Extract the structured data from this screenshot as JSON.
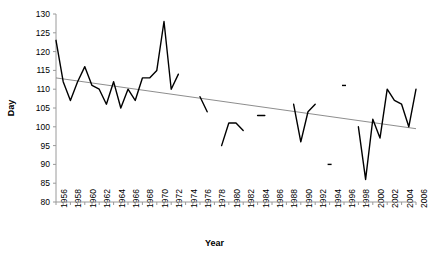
{
  "chart_data": {
    "type": "line",
    "title": "",
    "xlabel": "Year",
    "ylabel": "Day",
    "xlim": [
      1956,
      2006
    ],
    "ylim": [
      80,
      130
    ],
    "yticks": [
      80,
      85,
      90,
      95,
      100,
      105,
      110,
      115,
      120,
      125,
      130
    ],
    "xticks": [
      1956,
      1958,
      1960,
      1962,
      1964,
      1966,
      1968,
      1970,
      1972,
      1974,
      1976,
      1978,
      1980,
      1982,
      1984,
      1986,
      1988,
      1990,
      1992,
      1994,
      1996,
      1998,
      2000,
      2002,
      2004,
      2006
    ],
    "xtick_step": 2,
    "minor_xtick_step": 1,
    "grid": false,
    "legend": false,
    "series": [
      {
        "name": "Day",
        "color": "#000000",
        "x": [
          1956,
          1957,
          1958,
          1959,
          1960,
          1961,
          1962,
          1963,
          1964,
          1965,
          1966,
          1967,
          1968,
          1969,
          1970,
          1971,
          1972,
          1973,
          1974,
          1976,
          1977,
          1979,
          1980,
          1981,
          1982,
          1984,
          1985,
          1989,
          1990,
          1991,
          1992,
          1994,
          1996,
          1998,
          1999,
          2000,
          2001,
          2002,
          2003,
          2004,
          2005,
          2006
        ],
        "values": [
          123,
          112,
          107,
          112,
          116,
          111,
          110,
          106,
          112,
          105,
          110,
          107,
          113,
          113,
          115,
          128,
          110,
          114,
          null,
          108,
          104,
          95,
          101,
          101,
          99,
          103,
          103,
          106,
          96,
          104,
          106,
          90,
          111,
          100,
          86,
          102,
          97,
          110,
          107,
          106,
          100,
          110
        ]
      }
    ],
    "trendline": {
      "name": "Linear trend",
      "color": "#808080",
      "x": [
        1956,
        2006
      ],
      "values": [
        113,
        99.5
      ]
    },
    "segments": [
      {
        "years": [
          1956,
          1974
        ],
        "note": "continuous"
      },
      {
        "years": [
          1976,
          1977
        ],
        "note": "short segment"
      },
      {
        "years": [
          1979,
          1982
        ],
        "note": "short segment"
      },
      {
        "years": [
          1984,
          1985
        ],
        "note": "isolated dash"
      },
      {
        "years": [
          1989,
          1992
        ],
        "note": "short segment"
      },
      {
        "years": [
          1994,
          1996
        ],
        "note": "short segment"
      },
      {
        "years": [
          1998,
          2006
        ],
        "note": "continuous"
      }
    ]
  },
  "axis": {
    "y_title": "Day",
    "x_title": "Year"
  }
}
